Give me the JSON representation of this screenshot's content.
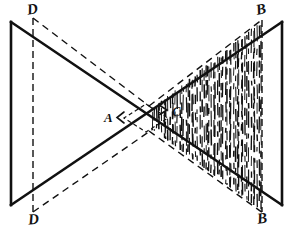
{
  "figure": {
    "canvas": {
      "width": 290,
      "height": 233,
      "background": "#ffffff"
    },
    "ink_color": "#111111",
    "labels": {
      "d_top": "D",
      "d_bottom": "D",
      "b_top": "B",
      "b_bottom": "B",
      "a_point": "A",
      "c_point": "C"
    },
    "vertices": {
      "left_plane_top": {
        "x": 11,
        "y": 22
      },
      "left_plane_bottom": {
        "x": 11,
        "y": 205
      },
      "right_plane_top": {
        "x": 282,
        "y": 22
      },
      "right_plane_bottom": {
        "x": 282,
        "y": 205
      },
      "d_top_point": {
        "x": 33,
        "y": 18
      },
      "d_bottom_point": {
        "x": 33,
        "y": 212
      },
      "b_top_point": {
        "x": 262,
        "y": 20
      },
      "b_bottom_point": {
        "x": 262,
        "y": 212
      },
      "crossing_point": {
        "x": 146,
        "y": 118
      },
      "a_marker": {
        "x": 120,
        "y": 117
      },
      "c_marker": {
        "x": 164,
        "y": 110
      }
    },
    "solid_lines": [
      {
        "name": "ray-topleft-to-bottomright",
        "x1": 11,
        "y1": 22,
        "x2": 282,
        "y2": 205
      },
      {
        "name": "ray-bottomleft-to-topright",
        "x1": 11,
        "y1": 205,
        "x2": 282,
        "y2": 22
      },
      {
        "name": "left-plane-edge",
        "x1": 11,
        "y1": 22,
        "x2": 11,
        "y2": 205
      },
      {
        "name": "right-plane-edge",
        "x1": 282,
        "y1": 22,
        "x2": 282,
        "y2": 205
      }
    ],
    "dashed_lines": [
      {
        "name": "dd-axis-left",
        "x1": 33,
        "y1": 18,
        "x2": 33,
        "y2": 212
      },
      {
        "name": "bb-axis-right",
        "x1": 262,
        "y1": 20,
        "x2": 262,
        "y2": 212
      },
      {
        "name": "d-top-to-c",
        "x1": 33,
        "y1": 18,
        "x2": 152,
        "y2": 108
      },
      {
        "name": "d-bottom-to-c",
        "x1": 33,
        "y1": 212,
        "x2": 152,
        "y2": 130
      },
      {
        "name": "c-to-b-top",
        "x1": 152,
        "y1": 108,
        "x2": 262,
        "y2": 20
      },
      {
        "name": "c-to-b-bottom",
        "x1": 152,
        "y1": 130,
        "x2": 262,
        "y2": 212
      }
    ],
    "hatching": {
      "style": "vertical-line-shading",
      "region": "right-shaded-band",
      "bounds_note": "between upper and lower dashed rays from C to B",
      "line_count": 58
    },
    "arrow_markers": [
      {
        "name": "a-arrow",
        "direction": "left",
        "x": 118,
        "y": 117
      },
      {
        "name": "c-arrow",
        "direction": "right",
        "x": 164,
        "y": 110
      }
    ]
  }
}
